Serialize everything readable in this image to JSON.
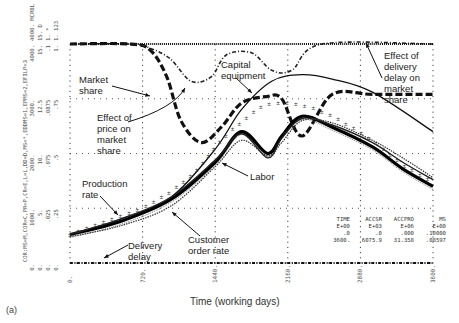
{
  "panel_label": "(a)",
  "chart_data": {
    "type": "line",
    "title": "",
    "xlabel": "Time (working days)",
    "x_ticks": [
      "0.",
      "720.",
      "1440.",
      "2160.",
      "2880.",
      "3600."
    ],
    "xlim": [
      0,
      3600
    ],
    "y_axis_legend": "COR:MS=M,COR=C,PR=P,CR=E,L=L,DD=D,MS=*,EDDMS=1,EPMS=2,EFILP=3",
    "y_scales": [
      {
        "ticks": [
          "0.",
          "1000.",
          "2000.",
          "3000.",
          "4000."
        ],
        "name": "COR/PR/CR/MCRBL"
      },
      {
        "ticks": [
          "0.",
          "5.",
          "10.",
          "12.5",
          "15."
        ],
        "name": "DD"
      },
      {
        "ticks": [
          "0.",
          ".025",
          ".075",
          ".0875",
          ".1"
        ],
        "name": "MS"
      },
      {
        "ticks": [
          "0.",
          ".25",
          ".5",
          ".75",
          "1."
        ],
        "name": "Effects"
      }
    ],
    "grid": true,
    "series": [
      {
        "name": "Market share",
        "style": "heavy-dash",
        "x": [
          0,
          600,
          800,
          960,
          1100,
          1300,
          1500,
          1700,
          1950,
          2100,
          2300,
          2600,
          3000,
          3600
        ],
        "y": [
          1.0,
          1.0,
          0.97,
          0.85,
          0.65,
          0.55,
          0.62,
          0.73,
          0.76,
          0.75,
          0.58,
          0.77,
          0.77,
          0.77
        ]
      },
      {
        "name": "Effect of price on market share",
        "style": "dash-dot",
        "x": [
          0,
          600,
          800,
          1000,
          1200,
          1400,
          1550,
          1800,
          2000,
          2200,
          2500,
          3600
        ],
        "y": [
          1.0,
          1.0,
          0.98,
          0.93,
          0.83,
          0.85,
          0.95,
          0.96,
          0.88,
          0.88,
          1.0,
          1.0
        ]
      },
      {
        "name": "Effect of delivery delay on market share",
        "style": "dotted",
        "x": [
          0,
          3600
        ],
        "y": [
          1.0,
          1.0
        ]
      },
      {
        "name": "Capital equipment",
        "style": "solid-thin",
        "x": [
          0,
          500,
          1000,
          1440,
          1700,
          2000,
          2300,
          2600,
          3000,
          3600
        ],
        "y": [
          0.13,
          0.2,
          0.3,
          0.52,
          0.7,
          0.83,
          0.86,
          0.84,
          0.78,
          0.6
        ]
      },
      {
        "name": "Labor",
        "style": "solid-heavy",
        "x": [
          0,
          500,
          1000,
          1440,
          1700,
          1960,
          2100,
          2300,
          2600,
          3000,
          3300,
          3600
        ],
        "y": [
          0.13,
          0.19,
          0.29,
          0.46,
          0.6,
          0.5,
          0.58,
          0.67,
          0.62,
          0.53,
          0.43,
          0.35
        ]
      },
      {
        "name": "Production rate",
        "style": "solid",
        "x": [
          0,
          500,
          1000,
          1440,
          1700,
          1960,
          2100,
          2300,
          2600,
          3000,
          3300,
          3600
        ],
        "y": [
          0.13,
          0.2,
          0.3,
          0.47,
          0.59,
          0.48,
          0.57,
          0.66,
          0.63,
          0.55,
          0.46,
          0.38
        ]
      },
      {
        "name": "Customer order rate",
        "style": "dotted-marker",
        "x": [
          0,
          500,
          1000,
          1440,
          1700,
          1960,
          2100,
          2300,
          2600,
          3000,
          3300,
          3600
        ],
        "y": [
          0.12,
          0.17,
          0.26,
          0.44,
          0.56,
          0.49,
          0.55,
          0.65,
          0.64,
          0.56,
          0.48,
          0.39
        ]
      },
      {
        "name": "Order backlog (M)",
        "style": "markers",
        "x": [
          0,
          400,
          800,
          1200,
          1500,
          1800,
          2000,
          2300,
          2600,
          3000,
          3300,
          3600
        ],
        "y": [
          0.13,
          0.2,
          0.27,
          0.4,
          0.56,
          0.68,
          0.73,
          0.72,
          0.67,
          0.56,
          0.45,
          0.37
        ]
      },
      {
        "name": "Delivery delay",
        "style": "dash-dot-marker",
        "x": [
          0,
          3600
        ],
        "y": [
          0.0,
          0.0
        ]
      }
    ],
    "summary_table": {
      "columns": [
        "TIME",
        "ACCSR",
        "ACCPRO",
        "MS"
      ],
      "units": [
        "E+00",
        "E+03",
        "E+06",
        "E+00"
      ],
      "rows": [
        [
          ".0",
          ".0",
          ".000",
          ".10000"
        ],
        [
          "3600.",
          "6075.9",
          "31.358",
          ".08597"
        ]
      ]
    }
  },
  "annotations": {
    "market_share": "Market\nshare",
    "effect_price": "Effect of\nprice on\nmarket\nshare",
    "capital_equipment": "Capital\nequipment",
    "effect_delivery": "Effect of\ndelivery\ndelay on\nmarket\nshare",
    "production_rate": "Production\nrate",
    "labor": "Labor",
    "customer_order_rate": "Customer\norder rate",
    "delivery_delay": "Delivery\ndelay"
  },
  "axis_top_labels": [
    "4000.  MCRBL",
    "15.  D",
    "1.  *",
    "1.  123"
  ]
}
